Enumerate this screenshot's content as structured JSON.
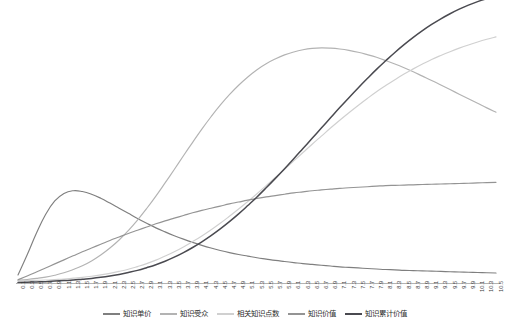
{
  "chart_data": {
    "type": "line",
    "title": "",
    "subtitle": "",
    "xlabel": "",
    "ylabel": "",
    "grid": false,
    "legend_position": "bottom",
    "xlim": [
      0.1,
      10.5
    ],
    "ylim": [
      0,
      100
    ],
    "x_tick_step": 0.2,
    "x": [
      0.1,
      0.3,
      0.5,
      0.7,
      0.9,
      1.1,
      1.3,
      1.5,
      1.7,
      1.9,
      2.1,
      2.3,
      2.5,
      2.7,
      2.9,
      3.1,
      3.3,
      3.5,
      3.7,
      3.9,
      4.1,
      4.3,
      4.5,
      4.7,
      4.9,
      5.1,
      5.3,
      5.5,
      5.7,
      5.9,
      6.1,
      6.3,
      6.5,
      6.7,
      6.9,
      7.1,
      7.3,
      7.5,
      7.7,
      7.9,
      8.1,
      8.3,
      8.5,
      8.7,
      8.9,
      9.1,
      9.3,
      9.5,
      9.7,
      9.9,
      10.1,
      10.3,
      10.5
    ],
    "categories": [
      "0.1",
      "0.3",
      "0.5",
      "0.7",
      "0.9",
      "1.1",
      "1.3",
      "1.5",
      "1.7",
      "1.9",
      "2.1",
      "2.3",
      "2.5",
      "2.7",
      "2.9",
      "3.1",
      "3.3",
      "3.5",
      "3.7",
      "3.9",
      "4.1",
      "4.3",
      "4.5",
      "4.7",
      "4.9",
      "5.1",
      "5.3",
      "5.5",
      "5.7",
      "5.9",
      "6.1",
      "6.3",
      "6.5",
      "6.7",
      "6.9",
      "7.1",
      "7.3",
      "7.5",
      "7.7",
      "7.9",
      "8.1",
      "8.3",
      "8.5",
      "8.7",
      "8.9",
      "9.1",
      "9.3",
      "9.5",
      "9.7",
      "9.9",
      "10.1",
      "10.3",
      "10.5"
    ],
    "series": [
      {
        "name": "知识单价",
        "color": "#7f7f7f",
        "values": [
          3.0,
          10.5,
          18.5,
          25.5,
          30.5,
          33.3,
          34.3,
          34.0,
          33.0,
          31.5,
          29.7,
          27.8,
          25.9,
          24.0,
          22.2,
          20.5,
          19.0,
          17.6,
          16.3,
          15.1,
          14.0,
          13.0,
          12.1,
          11.3,
          10.6,
          10.0,
          9.4,
          8.9,
          8.4,
          8.0,
          7.6,
          7.2,
          6.9,
          6.6,
          6.3,
          6.0,
          5.8,
          5.6,
          5.4,
          5.2,
          5.0,
          4.9,
          4.7,
          4.6,
          4.5,
          4.4,
          4.3,
          4.2,
          4.1,
          4.0,
          3.9,
          3.8,
          3.7
        ]
      },
      {
        "name": "知识受众",
        "color": "#b3b3b3",
        "values": [
          1.0,
          1.3,
          1.7,
          2.2,
          2.9,
          3.8,
          5.0,
          6.4,
          8.2,
          10.4,
          13.0,
          16.0,
          19.5,
          23.4,
          27.7,
          32.3,
          37.2,
          42.2,
          47.3,
          52.3,
          57.2,
          61.8,
          66.1,
          70.0,
          73.5,
          76.6,
          79.3,
          81.5,
          83.3,
          84.8,
          85.9,
          86.7,
          87.2,
          87.4,
          87.3,
          87.0,
          86.5,
          85.8,
          84.9,
          83.9,
          82.7,
          81.4,
          80.0,
          78.5,
          76.9,
          75.3,
          73.6,
          71.9,
          70.2,
          68.5,
          66.8,
          65.1,
          63.5
        ]
      },
      {
        "name": "相关知识点数",
        "color": "#d0d0d0",
        "values": [
          0.8,
          0.9,
          1.0,
          1.1,
          1.3,
          1.5,
          1.8,
          2.1,
          2.5,
          3.0,
          3.6,
          4.3,
          5.1,
          6.1,
          7.2,
          8.5,
          10.0,
          11.6,
          13.4,
          15.4,
          17.5,
          19.8,
          22.2,
          24.8,
          27.5,
          30.3,
          33.2,
          36.2,
          39.2,
          42.3,
          45.4,
          48.5,
          51.6,
          54.6,
          57.6,
          60.5,
          63.3,
          66.0,
          68.6,
          71.1,
          73.4,
          75.6,
          77.7,
          79.6,
          81.4,
          83.1,
          84.6,
          86.0,
          87.3,
          88.5,
          89.6,
          90.6,
          91.5
        ]
      },
      {
        "name": "知识价值",
        "color": "#949494",
        "values": [
          1.2,
          2.6,
          4.1,
          5.6,
          7.1,
          8.6,
          10.1,
          11.6,
          13.0,
          14.4,
          15.8,
          17.1,
          18.4,
          19.6,
          20.8,
          22.0,
          23.1,
          24.1,
          25.1,
          26.1,
          27.0,
          27.8,
          28.6,
          29.4,
          30.1,
          30.8,
          31.4,
          32.0,
          32.5,
          33.0,
          33.5,
          33.9,
          34.3,
          34.6,
          34.9,
          35.2,
          35.4,
          35.6,
          35.8,
          36.0,
          36.2,
          36.3,
          36.4,
          36.5,
          36.6,
          36.7,
          36.8,
          36.9,
          37.0,
          37.1,
          37.2,
          37.3,
          37.4
        ]
      },
      {
        "name": "知识累计价值",
        "color": "#4a4a50",
        "values": [
          0.2,
          0.3,
          0.4,
          0.5,
          0.7,
          0.9,
          1.1,
          1.4,
          1.7,
          2.1,
          2.6,
          3.2,
          3.9,
          4.7,
          5.7,
          6.8,
          8.1,
          9.6,
          11.3,
          13.2,
          15.3,
          17.6,
          20.1,
          22.8,
          25.7,
          28.8,
          32.0,
          35.4,
          38.9,
          42.5,
          46.2,
          50.0,
          53.8,
          57.6,
          61.4,
          65.2,
          68.9,
          72.5,
          76.0,
          79.4,
          82.6,
          85.7,
          88.6,
          91.3,
          93.8,
          96.1,
          98.2,
          100.1,
          101.8,
          103.3,
          104.6,
          105.7,
          106.6
        ]
      }
    ]
  },
  "legend": {
    "items": [
      {
        "label": "知识单价",
        "color": "#7f7f7f"
      },
      {
        "label": "知识受众",
        "color": "#b3b3b3"
      },
      {
        "label": "相关知识点数",
        "color": "#d0d0d0"
      },
      {
        "label": "知识价值",
        "color": "#949494"
      },
      {
        "label": "知识累计价值",
        "color": "#4a4a50"
      }
    ]
  },
  "axis": {
    "x_axis_color": "#aaaaaa"
  }
}
